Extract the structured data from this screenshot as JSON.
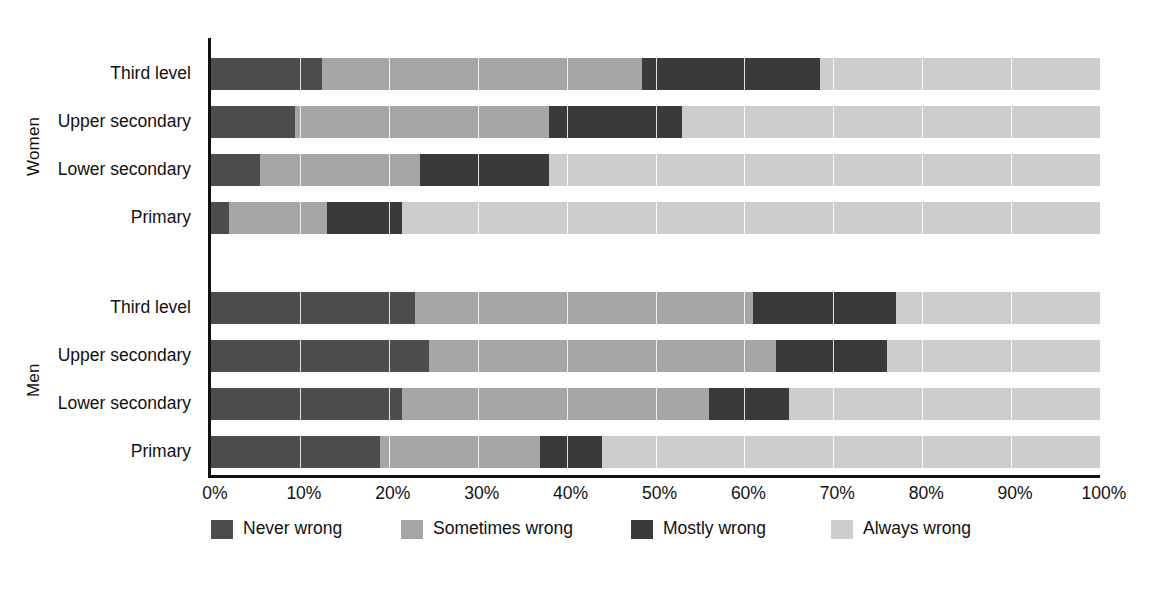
{
  "chart_data": {
    "type": "bar",
    "orientation": "horizontal",
    "stacked": true,
    "stack_mode": "percent",
    "title": "",
    "subtitle": "",
    "xlabel": "",
    "ylabel": "",
    "xlim": [
      0,
      100
    ],
    "xticks": [
      "0%",
      "10%",
      "20%",
      "30%",
      "40%",
      "50%",
      "60%",
      "70%",
      "80%",
      "90%",
      "100%"
    ],
    "xtick_values": [
      0,
      10,
      20,
      30,
      40,
      50,
      60,
      70,
      80,
      90,
      100
    ],
    "grid": "vertical-white-gridlines",
    "legend_position": "bottom",
    "groups": [
      {
        "name": "Women",
        "categories": [
          "Third level",
          "Upper secondary",
          "Lower secondary",
          "Primary"
        ],
        "rows": [
          {
            "category": "Third level",
            "values": [
              12.5,
              36.0,
              20.0,
              31.5
            ]
          },
          {
            "category": "Upper secondary",
            "values": [
              9.5,
              28.5,
              15.0,
              47.0
            ]
          },
          {
            "category": "Lower secondary",
            "values": [
              5.5,
              18.0,
              14.5,
              62.0
            ]
          },
          {
            "category": "Primary",
            "values": [
              2.0,
              11.0,
              8.5,
              78.5
            ]
          }
        ]
      },
      {
        "name": "Men",
        "categories": [
          "Third level",
          "Upper secondary",
          "Lower secondary",
          "Primary"
        ],
        "rows": [
          {
            "category": "Third level",
            "values": [
              23.0,
              38.0,
              16.0,
              23.0
            ]
          },
          {
            "category": "Upper secondary",
            "values": [
              24.5,
              39.0,
              12.5,
              24.0
            ]
          },
          {
            "category": "Lower secondary",
            "values": [
              21.5,
              34.5,
              9.0,
              35.0
            ]
          },
          {
            "category": "Primary",
            "values": [
              19.0,
              18.0,
              7.0,
              56.0
            ]
          }
        ]
      }
    ],
    "series": [
      {
        "name": "Never wrong",
        "color": "#4d4d4d"
      },
      {
        "name": "Sometimes wrong",
        "color": "#a6a6a6"
      },
      {
        "name": "Mostly wrong",
        "color": "#3a3a3a"
      },
      {
        "name": "Always wrong",
        "color": "#cdcdcd"
      }
    ]
  },
  "legend": {
    "items": [
      {
        "label": "Never wrong",
        "color": "#4d4d4d"
      },
      {
        "label": "Sometimes wrong",
        "color": "#a6a6a6"
      },
      {
        "label": "Mostly wrong",
        "color": "#3a3a3a"
      },
      {
        "label": "Always wrong",
        "color": "#cdcdcd"
      }
    ]
  },
  "axis": {
    "group_labels": [
      "Women",
      "Men"
    ],
    "tick_labels": [
      "0%",
      "10%",
      "20%",
      "30%",
      "40%",
      "50%",
      "60%",
      "70%",
      "80%",
      "90%",
      "100%"
    ],
    "category_labels": [
      "Third level",
      "Upper secondary",
      "Lower secondary",
      "Primary",
      "Third level",
      "Upper secondary",
      "Lower secondary",
      "Primary"
    ]
  },
  "colors": {
    "never_wrong": "#4d4d4d",
    "sometimes_wrong": "#a6a6a6",
    "mostly_wrong": "#3a3a3a",
    "always_wrong": "#cdcdcd",
    "axis": "#111111",
    "background": "#ffffff"
  }
}
